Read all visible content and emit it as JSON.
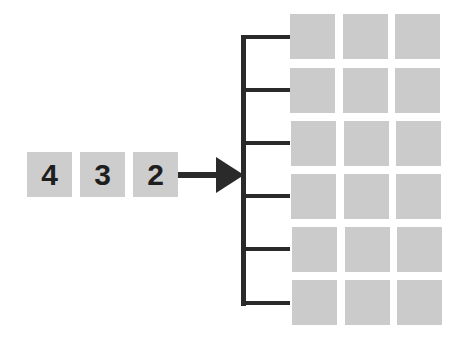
{
  "diagram": {
    "input_sequence": [
      "4",
      "3",
      "2"
    ],
    "arrow": {
      "direction": "right"
    },
    "bracket": {
      "branches": 6
    },
    "grid": {
      "rows": 6,
      "columns": 3
    },
    "colors": {
      "box_fill": "#cdcdcd",
      "line": "#2a2a2a",
      "text": "#1e1e1e",
      "background": "#ffffff"
    }
  }
}
